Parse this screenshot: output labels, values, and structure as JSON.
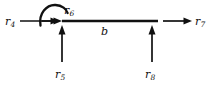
{
  "diagram": {
    "type": "free-body-diagram",
    "background_color": "#ffffff",
    "stroke_color": "#111111",
    "beam": {
      "name": "beam",
      "length_label": "b",
      "x_start": 62,
      "x_end": 158,
      "y": 21
    },
    "labels": {
      "r4": {
        "base": "r",
        "sub": "4"
      },
      "r5": {
        "base": "r",
        "sub": "5"
      },
      "r6": {
        "base": "r",
        "sub": "6"
      },
      "r7": {
        "base": "r",
        "sub": "7"
      },
      "r8": {
        "base": "r",
        "sub": "8"
      },
      "b": "b"
    },
    "forces": [
      {
        "id": "r4",
        "label": "r4",
        "kind": "force",
        "direction": "right",
        "from": [
          20,
          21
        ],
        "to": [
          62,
          21
        ]
      },
      {
        "id": "r5",
        "label": "r5",
        "kind": "force",
        "direction": "up",
        "from": [
          62,
          62
        ],
        "to": [
          62,
          26
        ]
      },
      {
        "id": "r6",
        "label": "r6",
        "kind": "moment",
        "direction": "clockwise",
        "center": [
          52,
          21
        ]
      },
      {
        "id": "r7",
        "label": "r7",
        "kind": "force",
        "direction": "right",
        "from": [
          163,
          21
        ],
        "to": [
          192,
          21
        ]
      },
      {
        "id": "r8",
        "label": "r8",
        "kind": "force",
        "direction": "up",
        "from": [
          152,
          62
        ],
        "to": [
          152,
          26
        ]
      }
    ]
  }
}
